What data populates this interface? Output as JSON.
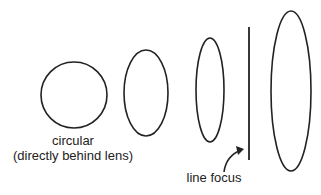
{
  "diagram": {
    "shapes": [
      {
        "name": "circular-spot",
        "cx": 74,
        "cy": 95,
        "rx": 33,
        "ry": 33
      },
      {
        "name": "ellipse-1",
        "cx": 146,
        "cy": 93,
        "rx": 22,
        "ry": 43
      },
      {
        "name": "ellipse-2",
        "cx": 210,
        "cy": 90,
        "rx": 14,
        "ry": 52
      },
      {
        "name": "ellipse-3",
        "cx": 291,
        "cy": 91,
        "rx": 20,
        "ry": 80
      }
    ],
    "line_focus": {
      "x": 249,
      "y1": 27,
      "y2": 160
    },
    "labels": {
      "circular_line1": "circular",
      "circular_line2": "(directly behind lens)",
      "line_focus": "line focus"
    },
    "stroke_color": "#222222"
  }
}
